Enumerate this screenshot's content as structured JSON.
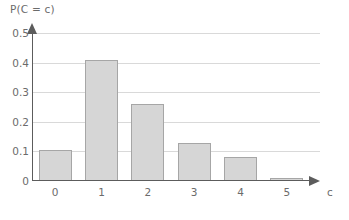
{
  "chart_data": {
    "type": "bar",
    "title": "",
    "ylabel": "P(C = c)",
    "xlabel": "c",
    "categories": [
      "0",
      "1",
      "2",
      "3",
      "4",
      "5"
    ],
    "values": [
      0.105,
      0.41,
      0.26,
      0.13,
      0.08,
      0.01
    ],
    "ylim": [
      0,
      0.5
    ],
    "y_ticks": [
      "0",
      "0.1",
      "0.2",
      "0.3",
      "0.4",
      "0.5"
    ],
    "y_tick_values": [
      0,
      0.1,
      0.2,
      0.3,
      0.4,
      0.5
    ],
    "grid": true,
    "grid_axis": "y",
    "legend": false,
    "series": [
      {
        "name": "P(C = c)",
        "values": [
          0.105,
          0.41,
          0.26,
          0.13,
          0.08,
          0.01
        ]
      }
    ],
    "colors": {
      "bar_fill": "#d6d6d6",
      "bar_border": "#a6a6a6",
      "axis": "#5c5c5c",
      "grid": "#d9d9d9",
      "text": "#6b6b6b",
      "background": "#ffffff"
    }
  }
}
